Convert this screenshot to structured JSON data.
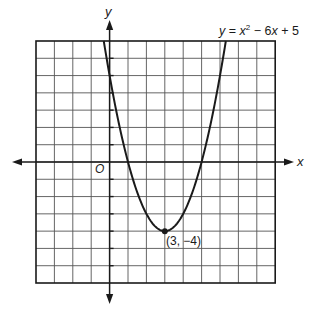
{
  "chart_data": {
    "type": "line",
    "title": "",
    "equation_label": {
      "y": "y",
      "eq": " = ",
      "x": "x",
      "sup": "2",
      "rest": " − 6",
      "x2": "x",
      "tail": " + 5"
    },
    "function": "y = x^2 - 6x + 5",
    "xlabel": "x",
    "ylabel": "y",
    "origin_label": "O",
    "xlim": [
      -4,
      9
    ],
    "ylim": [
      -7,
      7
    ],
    "grid": true,
    "grid_step": 1,
    "series": [
      {
        "name": "y = x^2 - 6x + 5",
        "x": [
          -0.32,
          0,
          1,
          2,
          3,
          4,
          5,
          6,
          6.32
        ],
        "y": [
          7,
          5,
          0,
          -3,
          -4,
          -3,
          0,
          5,
          7
        ]
      }
    ],
    "annotations": [
      {
        "point": [
          3,
          -4
        ],
        "label": "(3, −4)",
        "marker": "dot"
      }
    ]
  },
  "colors": {
    "ink": "#1a1a1a",
    "grid": "#555555",
    "background": "#ffffff"
  }
}
